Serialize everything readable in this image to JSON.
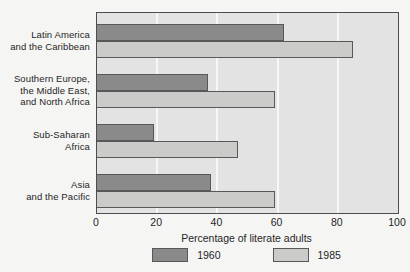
{
  "chart_data": {
    "type": "bar",
    "orientation": "horizontal",
    "xlabel": "Percentage of literate adults",
    "xlim": [
      0,
      100
    ],
    "xticks": [
      0,
      20,
      40,
      60,
      80,
      100
    ],
    "grid": true,
    "gridline_values": [
      20,
      40,
      60,
      80
    ],
    "legend_position": "bottom",
    "categories": [
      {
        "lines": [
          "Latin America",
          "and the Caribbean"
        ]
      },
      {
        "lines": [
          "Southern Europe,",
          "the Middle East,",
          "and North Africa"
        ]
      },
      {
        "lines": [
          "Sub-Saharan",
          "Africa"
        ]
      },
      {
        "lines": [
          "Asia",
          "and the Pacific"
        ]
      }
    ],
    "series": [
      {
        "name": "1960",
        "color": "#8a8a8a",
        "values": [
          62,
          37,
          19,
          38
        ]
      },
      {
        "name": "1985",
        "color": "#cbcbca",
        "values": [
          85,
          59,
          47,
          59
        ]
      }
    ],
    "colors": {
      "plot_background": "#e3e3e3",
      "frame_border": "#4d4d4d",
      "bar_border": "#585858",
      "gridline": "#f7f7f6",
      "page_background": "#f5f5f4",
      "text": "#262626"
    }
  }
}
